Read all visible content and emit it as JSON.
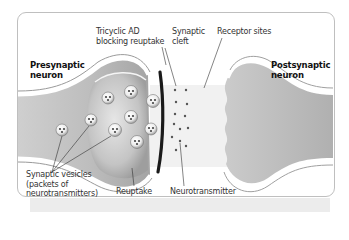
{
  "diagram": {
    "title_labels": {
      "presynaptic": [
        "Presynaptic",
        "neuron"
      ],
      "postsynaptic": [
        "Postsynaptic",
        "neuron"
      ]
    },
    "callouts": {
      "tricyclic": [
        "Tricyclic AD",
        "blocking reuptake"
      ],
      "cleft": [
        "Synaptic",
        "cleft"
      ],
      "receptor": "Receptor sites",
      "vesicles": [
        "Synaptic vesicles",
        "(packets of",
        "neurotransmitters)"
      ],
      "reuptake": "Reuptake",
      "neurotransmitter": "Neurotransmitter"
    },
    "colors": {
      "frame_border": "#bfbfbf",
      "neuron_fill_light": "#e8e8e8",
      "neuron_fill_dark": "#a9a9a9",
      "membrane_edge": "#ffffff",
      "blocker": "#1a1a1a",
      "cleft_band": "#f0f0f0",
      "text": "#333333"
    }
  }
}
